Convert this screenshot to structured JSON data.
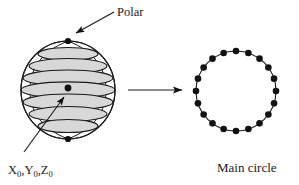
{
  "figure": {
    "title": "",
    "background_color": "#ffffff",
    "stroke_color": "#1a1a1a",
    "band_fill_color": "#d8d8d8",
    "dot_color": "#111111"
  },
  "labels": {
    "polar": "Polar",
    "main_circle": "Main circle",
    "coords": "X0,Y0,Z0",
    "coords_parts": {
      "x": "X",
      "y": "Y",
      "z": "Z",
      "subscript": "0",
      "separator": ","
    }
  },
  "sphere": {
    "name": "sphere-with-latitude-bands",
    "center_x": 68,
    "center_y": 90,
    "radius_x": 47,
    "radius_y": 49,
    "band_count": 7,
    "pole_dots": [
      {
        "label": "north-pole",
        "x": 68,
        "y": 41,
        "r": 3.1
      },
      {
        "label": "south-pole",
        "x": 68,
        "y": 139,
        "r": 3.1
      }
    ],
    "center_dot": {
      "x": 68,
      "y": 88,
      "r": 3.4
    },
    "bands": [
      {
        "cy": 54,
        "rx": 30,
        "ry": 6.5
      },
      {
        "cy": 66,
        "rx": 39,
        "ry": 7.5
      },
      {
        "cy": 78,
        "rx": 45,
        "ry": 8.0
      },
      {
        "cy": 90,
        "rx": 47,
        "ry": 8.2
      },
      {
        "cy": 102,
        "rx": 45,
        "ry": 8.0
      },
      {
        "cy": 114,
        "rx": 39,
        "ry": 7.5
      },
      {
        "cy": 126,
        "rx": 30,
        "ry": 6.5
      }
    ]
  },
  "main_circle": {
    "name": "main-circle-with-nodes",
    "center_x": 236,
    "center_y": 91,
    "radius": 40,
    "node_count": 20,
    "node_radius": 3.3,
    "start_angle_deg": -90
  },
  "arrows": {
    "polar_pointer": {
      "from_x": 114,
      "from_y": 12,
      "to_x": 74,
      "to_y": 34,
      "head_size": 7
    },
    "transform": {
      "from_x": 128,
      "from_y": 90,
      "to_x": 185,
      "to_y": 90,
      "head_size": 8
    },
    "coords_pointer": {
      "from_x": 24,
      "from_y": 152,
      "to_x": 66,
      "to_y": 95,
      "head_size": 7
    }
  },
  "text_positions": {
    "polar": {
      "x": 117,
      "y": 16
    },
    "main_circle": {
      "x": 217,
      "y": 172
    },
    "coords": {
      "x": 8,
      "y": 174
    }
  }
}
